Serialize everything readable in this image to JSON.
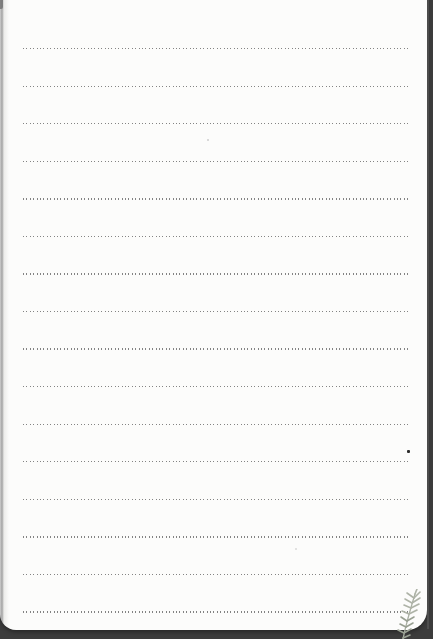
{
  "page": {
    "paper_color": "#fcfcfb",
    "backdrop_color": "#3c3c3c",
    "left_edge_color": "#a2a2a2",
    "bottom_edge_y": 630,
    "right_edge_x": 427
  },
  "ruled_lines": {
    "style": "dotted",
    "color": "#6e6e6e",
    "count": 16,
    "first_y": 48,
    "spacing": 37.55,
    "left_x": 23,
    "width": 387
  },
  "marks": [
    {
      "name": "ink-dot",
      "x": 407,
      "y": 450,
      "size": 3,
      "color": "#2d2d2d",
      "opacity": 1
    },
    {
      "name": "faint-speck",
      "x": 207,
      "y": 139,
      "size": 2,
      "color": "#c9c9c9",
      "opacity": 0.9
    },
    {
      "name": "faint-speck",
      "x": 295,
      "y": 548,
      "size": 2,
      "color": "#d6d6d4",
      "opacity": 0.9
    }
  ],
  "decoration": {
    "plant_sprig": {
      "stem_color": "#a9afa2",
      "leaf_color": "#aeb3a7",
      "leaf_color_dark": "#99a092",
      "position": "bottom-right"
    }
  }
}
